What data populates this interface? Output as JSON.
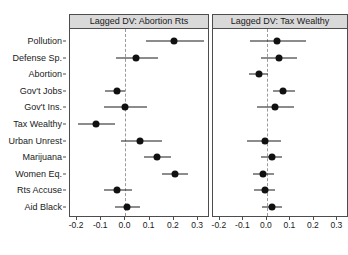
{
  "chart_data": {
    "type": "scatter",
    "plot_style": "coefficient-plot-with-confidence-intervals",
    "title": "",
    "xlabel": "",
    "ylabel": "",
    "xlim": [
      -0.225,
      0.345
    ],
    "xticks": [
      -0.2,
      -0.1,
      0.0,
      0.1,
      0.2,
      0.3
    ],
    "xticklabels": [
      "-0.2",
      "-0.1",
      "0.0",
      "0.1",
      "0.2",
      "0.3"
    ],
    "categories": [
      "Pollution",
      "Defense Sp.",
      "Abortion",
      "Gov't Jobs",
      "Gov't Ins.",
      "Tax Wealthy",
      "Urban Unrest",
      "Marijuana",
      "Women Eq.",
      "Rts Accuse",
      "Aid Black"
    ],
    "grid": false,
    "legend": null,
    "reference_line": 0.0,
    "reference_line_style": "dashed",
    "panels": [
      {
        "label": "Lagged DV: Abortion Rts",
        "points": [
          {
            "category": "Pollution",
            "estimate": 0.2,
            "lower": 0.085,
            "upper": 0.325
          },
          {
            "category": "Defense Sp.",
            "estimate": 0.045,
            "lower": -0.04,
            "upper": 0.135
          },
          {
            "category": "Abortion",
            "estimate": null,
            "lower": null,
            "upper": null
          },
          {
            "category": "Gov't Jobs",
            "estimate": -0.035,
            "lower": -0.085,
            "upper": 0.0
          },
          {
            "category": "Gov't Ins.",
            "estimate": 0.0,
            "lower": -0.09,
            "upper": 0.09
          },
          {
            "category": "Tax Wealthy",
            "estimate": -0.12,
            "lower": -0.195,
            "upper": -0.045
          },
          {
            "category": "Urban Unrest",
            "estimate": 0.06,
            "lower": -0.02,
            "upper": 0.15
          },
          {
            "category": "Marijuana",
            "estimate": 0.13,
            "lower": 0.075,
            "upper": 0.19
          },
          {
            "category": "Women Eq.",
            "estimate": 0.205,
            "lower": 0.15,
            "upper": 0.26
          },
          {
            "category": "Rts Accuse",
            "estimate": -0.035,
            "lower": -0.09,
            "upper": 0.025
          },
          {
            "category": "Aid Black",
            "estimate": 0.005,
            "lower": -0.045,
            "upper": 0.06
          }
        ]
      },
      {
        "label": "Lagged DV: Tax Wealthy",
        "points": [
          {
            "category": "Pollution",
            "estimate": 0.045,
            "lower": -0.07,
            "upper": 0.165
          },
          {
            "category": "Defense Sp.",
            "estimate": 0.05,
            "lower": -0.025,
            "upper": 0.13
          },
          {
            "category": "Abortion",
            "estimate": -0.035,
            "lower": -0.075,
            "upper": 0.005
          },
          {
            "category": "Gov't Jobs",
            "estimate": 0.07,
            "lower": 0.025,
            "upper": 0.12
          },
          {
            "category": "Gov't Ins.",
            "estimate": 0.035,
            "lower": -0.04,
            "upper": 0.115
          },
          {
            "category": "Tax Wealthy",
            "estimate": null,
            "lower": null,
            "upper": null
          },
          {
            "category": "Urban Unrest",
            "estimate": -0.01,
            "lower": -0.085,
            "upper": 0.06
          },
          {
            "category": "Marijuana",
            "estimate": 0.02,
            "lower": -0.025,
            "upper": 0.065
          },
          {
            "category": "Women Eq.",
            "estimate": -0.015,
            "lower": -0.06,
            "upper": 0.03
          },
          {
            "category": "Rts Accuse",
            "estimate": -0.01,
            "lower": -0.055,
            "upper": 0.035
          },
          {
            "category": "Aid Black",
            "estimate": 0.02,
            "lower": -0.02,
            "upper": 0.065
          }
        ]
      }
    ],
    "colors": {
      "point": "#111111",
      "interval": "#1a1a1a",
      "reference_line": "#9a9a9a",
      "panel_strip_bg": "#d9d9d9",
      "panel_border": "#4d4d4d",
      "plot_bg": "#ffffff",
      "text": "#1a1a1a"
    }
  }
}
